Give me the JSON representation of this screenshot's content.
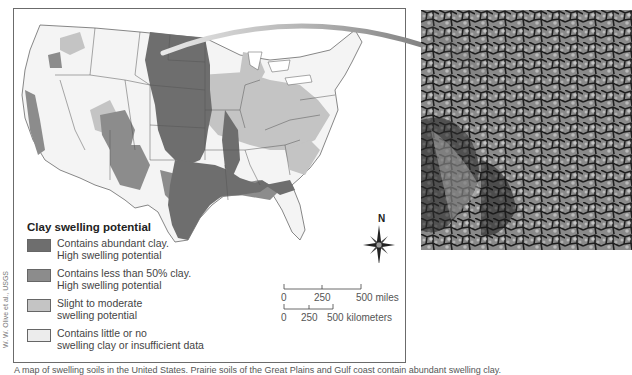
{
  "legend": {
    "title": "Clay swelling potential",
    "items": [
      {
        "line1": "Contains abundant clay.",
        "line2": "High swelling potential",
        "color": "#6e6e6e"
      },
      {
        "line1": "Contains less than 50% clay.",
        "line2": "High swelling potential",
        "color": "#8c8c8c"
      },
      {
        "line1": "Slight to moderate",
        "line2": "swelling potential",
        "color": "#c4c4c4"
      },
      {
        "line1": "Contains little or no",
        "line2": "swelling clay or insufficient data",
        "color": "#ececec"
      }
    ]
  },
  "north_arrow": {
    "label": "N"
  },
  "scale": {
    "miles": {
      "ticks": [
        "0",
        "250",
        "500 miles"
      ]
    },
    "kilometers": {
      "ticks": [
        "0",
        "250",
        "500 kilometers"
      ]
    }
  },
  "credit": "W. W. Olive et al., USGS",
  "caption": "A map of swelling soils in the United States. Prairie soils of the Great Plains and Gulf coast contain abundant swelling clay.",
  "colors": {
    "abundant": "#6e6e6e",
    "less_than_50": "#8c8c8c",
    "slight": "#c4c4c4",
    "little": "#ececec",
    "border": "#555555",
    "arrow": "#8a8a8a"
  },
  "photo": {
    "alt": "Cracked dry clay soil surface"
  }
}
